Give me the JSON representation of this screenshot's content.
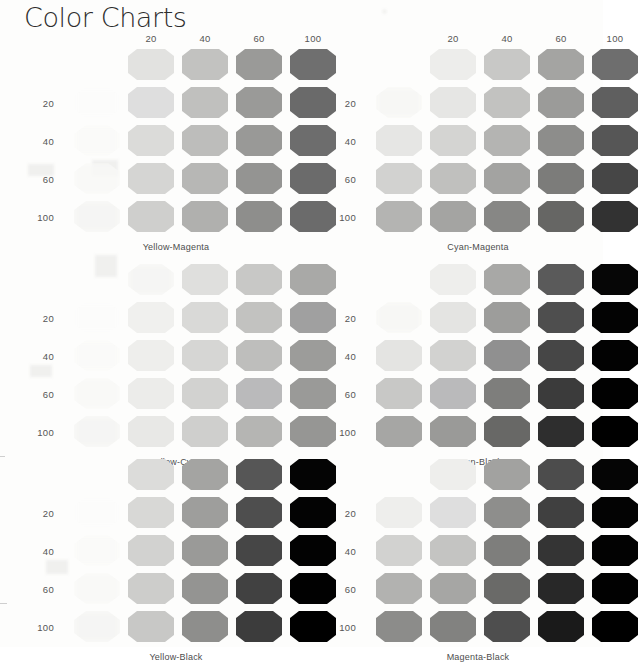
{
  "page": {
    "title": "Color Charts",
    "background_color": "#fdfdfc",
    "text_color": "#4d4d4d"
  },
  "axis": {
    "column_headers": [
      "20",
      "40",
      "60",
      "100"
    ],
    "row_labels": [
      "20",
      "40",
      "60",
      "100"
    ],
    "implied_zero": "0",
    "units": "percent"
  },
  "chart_data": [
    {
      "type": "heatmap",
      "title": "Yellow-Magenta",
      "xlabel": "Magenta %",
      "ylabel": "Yellow %",
      "x": [
        0,
        20,
        40,
        60,
        100
      ],
      "y": [
        0,
        20,
        40,
        60,
        100
      ],
      "grid": false,
      "legend": "none",
      "swatch_shape": "octagon",
      "values": [
        [
          "#ffffff",
          "#e2e2e0",
          "#c2c2c0",
          "#9a9a98",
          "#6f6f6f"
        ],
        [
          "#fcfcfb",
          "#dedede",
          "#c0c0be",
          "#9a9a98",
          "#6a6a6a"
        ],
        [
          "#fafaf8",
          "#dbdbd9",
          "#bdbdbb",
          "#999997",
          "#6d6d6d"
        ],
        [
          "#f8f8f6",
          "#d5d5d3",
          "#b7b7b5",
          "#949492",
          "#6b6b6b"
        ],
        [
          "#f4f4f2",
          "#cfcfcd",
          "#b0b0ae",
          "#8e8e8c",
          "#6b6b6b"
        ]
      ]
    },
    {
      "type": "heatmap",
      "title": "Cyan-Magenta",
      "xlabel": "Magenta %",
      "ylabel": "Cyan %",
      "x": [
        0,
        20,
        40,
        60,
        100
      ],
      "y": [
        0,
        20,
        40,
        60,
        100
      ],
      "grid": false,
      "legend": "none",
      "swatch_shape": "octagon",
      "values": [
        [
          "#ffffff",
          "#ededeb",
          "#c8c8c6",
          "#a4a4a2",
          "#6e6e6e"
        ],
        [
          "#f6f6f4",
          "#e6e6e4",
          "#c2c2c0",
          "#9b9b99",
          "#5f5f5f"
        ],
        [
          "#e6e6e4",
          "#d4d4d2",
          "#b4b4b2",
          "#8d8d8b",
          "#565656"
        ],
        [
          "#d2d2d0",
          "#c0c0be",
          "#a3a3a1",
          "#7c7c7a",
          "#464646"
        ],
        [
          "#b4b4b2",
          "#a4a4a2",
          "#878785",
          "#666664",
          "#323232"
        ]
      ]
    },
    {
      "type": "heatmap",
      "title": "Yellow-Cyan",
      "xlabel": "Cyan %",
      "ylabel": "Yellow %",
      "x": [
        0,
        20,
        40,
        60,
        100
      ],
      "y": [
        0,
        20,
        40,
        60,
        100
      ],
      "grid": false,
      "legend": "none",
      "swatch_shape": "octagon",
      "values": [
        [
          "#ffffff",
          "#f4f4f2",
          "#dfdfdd",
          "#c8c8c6",
          "#a9a9a7"
        ],
        [
          "#fcfcfb",
          "#f0f0ee",
          "#d9d9d7",
          "#c2c2c0",
          "#a0a0a0"
        ],
        [
          "#fafaf8",
          "#eeeeec",
          "#d6d6d4",
          "#bebebc",
          "#9c9c9a"
        ],
        [
          "#f8f8f6",
          "#ececea",
          "#d2d2d0",
          "#bababb",
          "#9a9a98"
        ],
        [
          "#f4f4f2",
          "#e8e8e6",
          "#cfcfcd",
          "#b5b5b3",
          "#969694"
        ]
      ]
    },
    {
      "type": "heatmap",
      "title": "Cyan-Black",
      "xlabel": "Black %",
      "ylabel": "Cyan %",
      "x": [
        0,
        20,
        40,
        60,
        100
      ],
      "y": [
        0,
        20,
        40,
        60,
        100
      ],
      "grid": false,
      "legend": "none",
      "swatch_shape": "octagon",
      "values": [
        [
          "#ffffff",
          "#eeeeec",
          "#a8a8a6",
          "#5a5a5a",
          "#060606"
        ],
        [
          "#f6f6f4",
          "#e4e4e2",
          "#9d9d9b",
          "#4e4e4e",
          "#030303"
        ],
        [
          "#e4e4e2",
          "#d2d2d0",
          "#909090",
          "#464646",
          "#020202"
        ],
        [
          "#c8c8c6",
          "#bababb",
          "#7e7e7c",
          "#3b3b3b",
          "#010101"
        ],
        [
          "#a6a6a4",
          "#9a9a98",
          "#686866",
          "#2e2e2e",
          "#000000"
        ]
      ]
    },
    {
      "type": "heatmap",
      "title": "Yellow-Black",
      "xlabel": "Black %",
      "ylabel": "Yellow %",
      "x": [
        0,
        20,
        40,
        60,
        100
      ],
      "y": [
        0,
        20,
        40,
        60,
        100
      ],
      "grid": false,
      "legend": "none",
      "swatch_shape": "octagon",
      "values": [
        [
          "#ffffff",
          "#dcdcda",
          "#a4a4a2",
          "#565656",
          "#040404"
        ],
        [
          "#fcfcfb",
          "#d8d8d6",
          "#9e9e9c",
          "#4e4e4e",
          "#030303"
        ],
        [
          "#fafaf8",
          "#d2d2d0",
          "#9a9a98",
          "#464646",
          "#020202"
        ],
        [
          "#f8f8f6",
          "#cdcdcb",
          "#949492",
          "#414141",
          "#010101"
        ],
        [
          "#f4f4f2",
          "#c8c8c6",
          "#8e8e8c",
          "#3c3c3c",
          "#000000"
        ]
      ]
    },
    {
      "type": "heatmap",
      "title": "Magenta-Black",
      "xlabel": "Black %",
      "ylabel": "Magenta %",
      "x": [
        0,
        20,
        40,
        60,
        100
      ],
      "y": [
        0,
        20,
        40,
        60,
        100
      ],
      "grid": false,
      "legend": "none",
      "swatch_shape": "octagon",
      "values": [
        [
          "#ffffff",
          "#eeeeec",
          "#a2a2a0",
          "#4c4c4c",
          "#050505"
        ],
        [
          "#eeeeec",
          "#dedede",
          "#8e8e8c",
          "#404040",
          "#030303"
        ],
        [
          "#d2d2d0",
          "#c4c4c2",
          "#7e7e7c",
          "#343434",
          "#020202"
        ],
        [
          "#b2b2b0",
          "#a6a6a4",
          "#6a6a68",
          "#282828",
          "#010101"
        ],
        [
          "#8c8c8a",
          "#828280",
          "#4e4e4e",
          "#1a1a1a",
          "#000000"
        ]
      ]
    }
  ],
  "layout": {
    "charts_per_row": 2,
    "chart_rows": 3,
    "headers_shown_on_rows": [
      1
    ]
  }
}
